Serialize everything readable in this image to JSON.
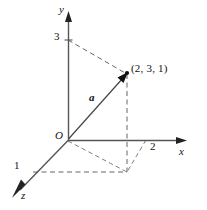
{
  "figure": {
    "background_color": "#ffffff",
    "axis_color": "#555555",
    "dash_color": "#666666",
    "vector_color": "#444444",
    "text_color": "#111111"
  },
  "axes": {
    "y": {
      "label": "y",
      "origin_px": [
        68,
        140
      ],
      "tip_px": [
        68,
        14
      ],
      "label_px": [
        59,
        5
      ],
      "ticks": [
        {
          "label": "3",
          "value": 3,
          "point_px": [
            68,
            40
          ],
          "label_px": [
            55,
            32
          ]
        }
      ]
    },
    "x": {
      "label": "x",
      "origin_px": [
        68,
        140
      ],
      "tip_px": [
        186,
        140
      ],
      "label_px": [
        180,
        146
      ],
      "ticks": [
        {
          "label": "2",
          "value": 2,
          "point_px": [
            146,
            140
          ],
          "label_px": [
            150,
            142
          ]
        }
      ]
    },
    "z": {
      "label": "z",
      "origin_px": [
        68,
        140
      ],
      "tip_px": [
        13,
        197
      ],
      "label_px": [
        21,
        191
      ],
      "ticks": [
        {
          "label": "1",
          "value": 1,
          "point_px": [
            33,
            172
          ],
          "label_px": [
            15,
            160
          ]
        }
      ]
    }
  },
  "origin": {
    "label": "O",
    "point_px": [
      68,
      140
    ],
    "label_px": [
      55,
      131
    ]
  },
  "vector": {
    "label": "a",
    "label_px": [
      89,
      93
    ],
    "from_px": [
      68,
      140
    ],
    "to_px": [
      127,
      74
    ],
    "components": [
      2,
      3,
      1
    ]
  },
  "point": {
    "label": "(2, 3, 1)",
    "coordinates": [
      2,
      3,
      1
    ],
    "point_px": [
      127,
      74
    ],
    "label_px": [
      131,
      64
    ]
  },
  "projections": {
    "base_corner_px": [
      127,
      172
    ],
    "guides": [
      {
        "name": "y-tick-to-point",
        "from_px": [
          68,
          40
        ],
        "to_px": [
          127,
          74
        ]
      },
      {
        "name": "point-to-base-vertical",
        "from_px": [
          127,
          74
        ],
        "to_px": [
          127,
          172
        ]
      },
      {
        "name": "x-tick-to-base",
        "from_px": [
          146,
          140
        ],
        "to_px": [
          127,
          172
        ]
      },
      {
        "name": "z-tick-to-base",
        "from_px": [
          33,
          172
        ],
        "to_px": [
          127,
          172
        ]
      },
      {
        "name": "origin-to-base-diagonal",
        "from_px": [
          68,
          140
        ],
        "to_px": [
          127,
          172
        ]
      }
    ]
  }
}
